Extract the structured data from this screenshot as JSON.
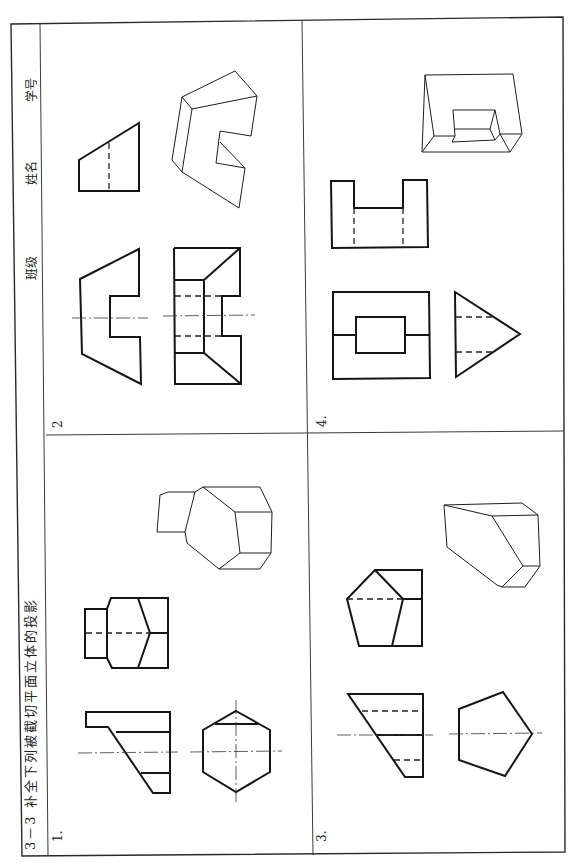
{
  "sheet": {
    "title": "3－3  补全下列被截切平面立体的投影",
    "header_fields": [
      "班级",
      "姓名",
      "学号"
    ]
  },
  "problems": [
    {
      "label": "1.",
      "description": "hexagonal prism with cut notch: front view, top view, isometric"
    },
    {
      "label": "2",
      "description": "prism with rectangular notch: front view, top view, side view, isometric"
    },
    {
      "label": "3.",
      "description": "pentagonal prism cut by planes: front view, top view, side view, isometric"
    },
    {
      "label": "4.",
      "description": "triangular prism with rectangular slot: front view, top view, side view, isometric"
    }
  ],
  "colors": {
    "line": "#151515",
    "paper": "#ffffff"
  }
}
